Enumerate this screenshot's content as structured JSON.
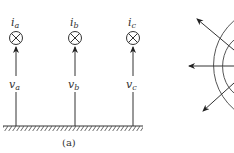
{
  "figure": {
    "panel_a": {
      "caption": "(a)",
      "conductors": [
        {
          "current_label": "i",
          "current_sub": "a",
          "voltage_label": "v",
          "voltage_sub": "a"
        },
        {
          "current_label": "i",
          "current_sub": "b",
          "voltage_label": "v",
          "voltage_sub": "b"
        },
        {
          "current_label": "i",
          "current_sub": "c",
          "voltage_label": "v",
          "voltage_sub": "c"
        }
      ],
      "ground": "hatched ground plane"
    },
    "panel_b": {
      "description": "concentric arcs with three outward radial arrows",
      "arrows": 3,
      "arcs": 2
    }
  }
}
